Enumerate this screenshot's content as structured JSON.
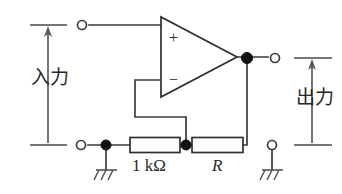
{
  "figure": {
    "kind": "circuit-diagram",
    "width": 342,
    "height": 194,
    "background_color": "#ffffff",
    "line_color": "#3a3a3a"
  },
  "labels": {
    "input_label": "入力",
    "output_label": "出力",
    "resistor_feedback_label": "1 kΩ",
    "resistor_series_label": "R"
  },
  "opamp": {
    "plus_sign": "+",
    "minus_sign": "−",
    "shape": "triangle",
    "apex_x": 237,
    "apex_y": 57
  },
  "components": [
    {
      "name": "resistor-1k",
      "type": "resistor",
      "label": "1 kΩ",
      "x": 130,
      "y": 138,
      "width": 50,
      "height": 15
    },
    {
      "name": "resistor-r",
      "type": "resistor",
      "label": "R",
      "x": 192,
      "y": 138,
      "width": 51,
      "height": 15
    }
  ],
  "terminals": [
    {
      "name": "input-top-terminal",
      "style": "open-circle",
      "cx": 82,
      "cy": 25
    },
    {
      "name": "input-bottom-terminal",
      "style": "open-circle",
      "cx": 81,
      "cy": 145
    },
    {
      "name": "output-top-terminal",
      "style": "open-circle",
      "cx": 275,
      "cy": 58
    },
    {
      "name": "output-bottom-terminal",
      "style": "open-circle",
      "cx": 272,
      "cy": 145
    }
  ],
  "nodes": [
    {
      "name": "input-ground-node",
      "cx": 106,
      "cy": 145
    },
    {
      "name": "feedback-divider-node",
      "cx": 186,
      "cy": 145
    },
    {
      "name": "output-node",
      "cx": 247,
      "cy": 58
    }
  ],
  "grounds": [
    {
      "name": "ground-input-side",
      "x": 106,
      "y": 145
    },
    {
      "name": "ground-output-side",
      "x": 272,
      "y": 145
    }
  ],
  "measurements": [
    {
      "name": "input-measure-arrow",
      "label": "入力",
      "orientation": "vertical",
      "x": 48,
      "top_y": 25,
      "bottom_y": 145
    },
    {
      "name": "output-measure-arrow",
      "label": "出力",
      "orientation": "vertical",
      "x": 312,
      "top_y": 58,
      "bottom_y": 145
    }
  ]
}
